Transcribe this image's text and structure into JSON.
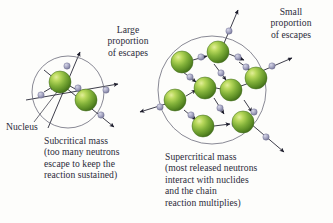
{
  "figure": {
    "title_hidden": "Nuclear chain reaction: subcritical vs supercritical mass",
    "background_color": "#fdfdfb",
    "text_color": "#2b2b3a",
    "circle_stroke": "#6b6b7a",
    "arrow_color": "#1b1b2a",
    "neutron_color": "#9a9ab4",
    "neutron_edge": "#6e6e8c",
    "nucleus_colors": {
      "highlight": "#cfe06a",
      "mid": "#7fae37",
      "edge": "#4a7a1e",
      "shadow": "#3c6417"
    }
  },
  "labels": {
    "large_escapes": "Large\nproportion\nof escapes",
    "small_escapes": "Small\nproportion\nof escapes",
    "nucleus": "Nucleus",
    "subcritical": "Subcritical mass\n(too many neutrons\nescape to keep the\nreaction sustained)",
    "supercritical": "Supercritical mass\n(most released neutrons\ninteract with nuclides\nand the chain\nreaction multiplies)"
  },
  "diagram": {
    "subcritical": {
      "circle": {
        "cx": 68,
        "cy": 92,
        "r": 36
      },
      "nuclei": [
        {
          "cx": 60,
          "cy": 82,
          "r": 11
        },
        {
          "cx": 86,
          "cy": 100,
          "r": 11
        }
      ],
      "neutrons": [
        {
          "cx": 78,
          "cy": 88,
          "r": 3.2
        },
        {
          "cx": 66,
          "cy": 65,
          "r": 3.2
        },
        {
          "cx": 41,
          "cy": 95,
          "r": 3.2
        },
        {
          "cx": 106,
          "cy": 92,
          "r": 3.2
        },
        {
          "cx": 103,
          "cy": 117,
          "r": 3.2
        }
      ]
    },
    "supercritical": {
      "circle": {
        "cx": 212,
        "cy": 90,
        "r": 54
      },
      "nuclei": [
        {
          "cx": 182,
          "cy": 62,
          "r": 11
        },
        {
          "cx": 218,
          "cy": 52,
          "r": 11
        },
        {
          "cx": 175,
          "cy": 100,
          "r": 11
        },
        {
          "cx": 205,
          "cy": 88,
          "r": 11
        },
        {
          "cx": 231,
          "cy": 90,
          "r": 11
        },
        {
          "cx": 253,
          "cy": 78,
          "r": 11
        },
        {
          "cx": 203,
          "cy": 126,
          "r": 11
        },
        {
          "cx": 242,
          "cy": 122,
          "r": 11
        }
      ],
      "neutrons": [
        {
          "cx": 200,
          "cy": 55,
          "r": 3.2
        },
        {
          "cx": 238,
          "cy": 55,
          "r": 3.2
        },
        {
          "cx": 232,
          "cy": 27,
          "r": 3.2
        },
        {
          "cx": 190,
          "cy": 80,
          "r": 3.2
        },
        {
          "cx": 220,
          "cy": 72,
          "r": 3.2
        },
        {
          "cx": 245,
          "cy": 68,
          "r": 3.2
        },
        {
          "cx": 158,
          "cy": 108,
          "r": 3.2
        },
        {
          "cx": 190,
          "cy": 110,
          "r": 3.2
        },
        {
          "cx": 220,
          "cy": 108,
          "r": 3.2
        },
        {
          "cx": 222,
          "cy": 127,
          "r": 3.2
        },
        {
          "cx": 252,
          "cy": 104,
          "r": 3.2
        },
        {
          "cx": 272,
          "cy": 70,
          "r": 3.2
        },
        {
          "cx": 268,
          "cy": 140,
          "r": 3.2
        }
      ]
    }
  }
}
